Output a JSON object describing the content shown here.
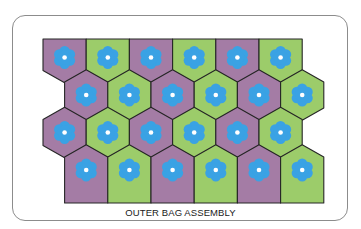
{
  "diagram": {
    "caption": "OUTER BAG ASSEMBLY",
    "colors": {
      "purple": "#a47ca5",
      "green": "#9ccc6a",
      "flower": "#3aa2e4",
      "flower_center": "#ffffff",
      "outline": "#262626",
      "card_border": "#8c8c8c"
    },
    "rows": [
      {
        "offset": false,
        "cells": [
          "purple",
          "green",
          "purple",
          "green",
          "purple",
          "green"
        ]
      },
      {
        "offset": true,
        "cells": [
          "purple",
          "green",
          "purple",
          "green",
          "purple",
          "green"
        ]
      },
      {
        "offset": false,
        "cells": [
          "purple",
          "green",
          "purple",
          "green",
          "purple",
          "green"
        ]
      },
      {
        "offset": true,
        "cells": [
          "purple",
          "green",
          "purple",
          "green",
          "purple",
          "green"
        ]
      }
    ]
  }
}
